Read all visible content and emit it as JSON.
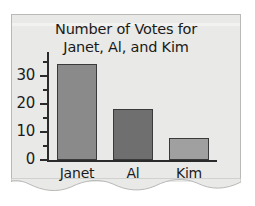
{
  "chart_data": {
    "type": "bar",
    "title": "Number of Votes for Janet, Al, and Kim",
    "title_line1": "Number of Votes for",
    "title_line2": "Janet, Al, and Kim",
    "categories": [
      "Janet",
      "Al",
      "Kim"
    ],
    "values": [
      34,
      18,
      8
    ],
    "bar_colors": [
      "#8a8a8a",
      "#6f6f6f",
      "#a0a0a0"
    ],
    "xlabel": "",
    "ylabel": "",
    "ylim": [
      0,
      37
    ],
    "y_major_ticks": [
      0,
      10,
      20,
      30
    ],
    "y_minor_ticks": [
      5,
      15,
      25,
      35
    ],
    "y_tick_labels": [
      "0",
      "10",
      "20",
      "30"
    ],
    "grid": false,
    "legend": false
  },
  "page": {
    "background_color": "#ffffff",
    "paper_color": "#e9e9e7",
    "axis_color": "#2b2b2b",
    "text_color": "#1a1a1a"
  }
}
